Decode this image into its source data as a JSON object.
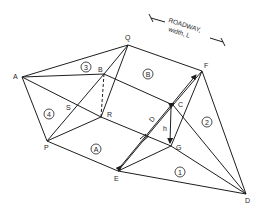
{
  "diagram": {
    "points": {
      "A": "A",
      "Q": "Q",
      "B": "B",
      "F": "F",
      "C": "C",
      "G": "G",
      "R": "R",
      "S": "S",
      "P": "P",
      "E": "E",
      "D": "D"
    },
    "regions": {
      "one": "1",
      "two": "2",
      "three": "3",
      "four": "4",
      "regA": "A",
      "regB": "B"
    },
    "dimensions": {
      "height": "h",
      "diagonal": "D",
      "roadway_line1": "ROADWAY,",
      "roadway_line2": "width, L"
    }
  }
}
